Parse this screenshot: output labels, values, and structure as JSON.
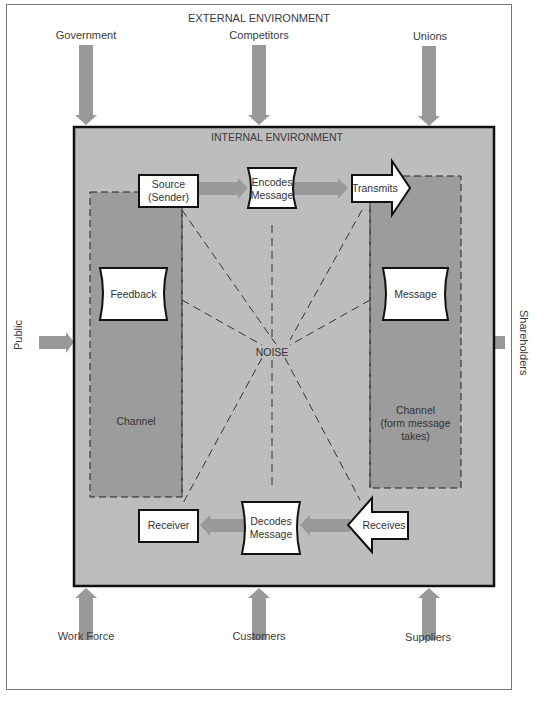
{
  "external": {
    "title": "EXTERNAL ENVIRONMENT",
    "top": [
      "Government",
      "Competitors",
      "Unions"
    ],
    "bottom": [
      "Work Force",
      "Customers",
      "Suppliers"
    ],
    "left": "Public",
    "right": "Shareholders"
  },
  "internal": {
    "title": "INTERNAL ENVIRONMENT",
    "source": "Source\n(Sender)",
    "source_l1": "Source",
    "source_l2": "(Sender)",
    "encodes_l1": "Encodes",
    "encodes_l2": "Message",
    "transmits": "Transmits",
    "feedback": "Feedback",
    "message": "Message",
    "noise": "NOISE",
    "channel_left": "Channel",
    "channel_right_l1": "Channel",
    "channel_right_l2": "(form message",
    "channel_right_l3": "takes)",
    "receiver": "Receiver",
    "decodes_l1": "Decodes",
    "decodes_l2": "Message",
    "receives": "Receives"
  },
  "colors": {
    "internal_bg": "#bdbdbd",
    "channel_bg": "#9c9c9c",
    "arrow_gray": "#999999",
    "box_fill": "#ffffff",
    "border": "#111111"
  }
}
